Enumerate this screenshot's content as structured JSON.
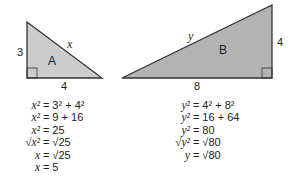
{
  "triangle_a": {
    "name": "A",
    "legs": [
      "3",
      "4"
    ],
    "hypotenuse": "x",
    "fill": "#cccccc",
    "stroke": "#333333"
  },
  "triangle_b": {
    "name": "B",
    "legs": [
      "4",
      "8"
    ],
    "hypotenuse": "y",
    "fill": "#b3b3b3",
    "stroke": "#333333"
  },
  "equations_a": [
    {
      "lhs": "x²",
      "rhs": "= 3² + 4²"
    },
    {
      "lhs": "x²",
      "rhs": "= 9 + 16"
    },
    {
      "lhs": "x²",
      "rhs": "= 25"
    },
    {
      "lhs": "√x²",
      "rhs": "= √25"
    },
    {
      "lhs": "x",
      "rhs": "= √25"
    },
    {
      "lhs": "x",
      "rhs": "= 5"
    }
  ],
  "equations_b": [
    {
      "lhs": "y²",
      "rhs": "= 4² + 8²"
    },
    {
      "lhs": "y²",
      "rhs": "= 16 + 64"
    },
    {
      "lhs": "y²",
      "rhs": "= 80"
    },
    {
      "lhs": "√y²",
      "rhs": "= √80"
    },
    {
      "lhs": "y",
      "rhs": "= √80"
    }
  ]
}
